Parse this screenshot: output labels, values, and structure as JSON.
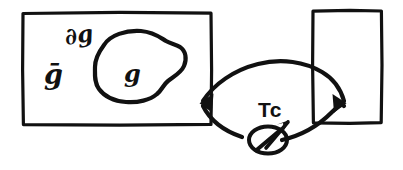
{
  "figure": {
    "background_color": "#ffffff",
    "ink_color": "#111111",
    "width": 403,
    "height": 170
  },
  "labels": {
    "ambient_region": "ḡ",
    "boundary": "∂g",
    "interior_region": "g",
    "arc_label": "Tc",
    "node_symbol": "∅"
  },
  "regions": [
    {
      "name": "left-rectangle",
      "kind": "rectangle",
      "x": 22,
      "y": 12,
      "width": 190,
      "height": 113,
      "label": "ḡ"
    },
    {
      "name": "right-rectangle",
      "kind": "rectangle",
      "x": 312,
      "y": 10,
      "width": 70,
      "height": 114,
      "label": ""
    },
    {
      "name": "interior-blob",
      "kind": "closed-curve",
      "label": "g",
      "boundary_label": "∂g"
    }
  ],
  "connector": {
    "name": "lens-arc",
    "kind": "two-arc-lens",
    "label": "Tc",
    "left_endpoint": {
      "x": 200,
      "y": 103,
      "arrowhead": true
    },
    "right_endpoint": {
      "x": 345,
      "y": 103,
      "arrowhead": true
    },
    "node": {
      "name": "crossed-circle-node",
      "symbol": "∅",
      "x": 268,
      "y": 140,
      "has_arrow_to_label": true
    }
  }
}
